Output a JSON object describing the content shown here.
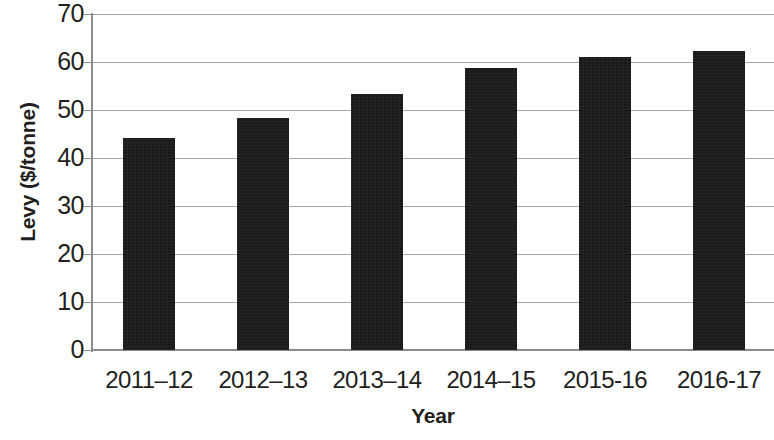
{
  "chart_data": {
    "type": "bar",
    "title": "",
    "xlabel": "Year",
    "ylabel": "Levy ($/tonne)",
    "categories": [
      "2011–12",
      "2012–13",
      "2013–14",
      "2014–15",
      "2015-16",
      "2016-17"
    ],
    "values": [
      44.2,
      48.3,
      53.3,
      58.8,
      61.0,
      62.2
    ],
    "ylim": [
      0,
      70
    ],
    "yticks": [
      0,
      10,
      20,
      30,
      40,
      50,
      60,
      70
    ],
    "ytick_labels": [
      "0",
      "10",
      "20",
      "30",
      "40",
      "50",
      "60",
      "70"
    ],
    "grid": true,
    "grid_axis": "y",
    "legend": false,
    "legend_position": "none",
    "bar_color": "#1a1a1a",
    "grid_color": "#a6a6a6",
    "axis_color": "#8c8c8c",
    "background_color": "#ffffff",
    "text_color": "#231f20"
  }
}
